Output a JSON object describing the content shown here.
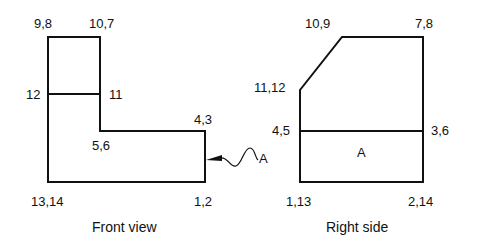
{
  "diagram": {
    "type": "orthographic-projection",
    "views": [
      {
        "id": "front",
        "title": "Front view",
        "vertex_labels": {
          "top_left": "9,8",
          "top_right": "10,7",
          "mid_left": "12",
          "mid_right": "11",
          "step_outer": "4,3",
          "step_inner": "5,6",
          "bottom_left": "13,14",
          "bottom_right": "1,2"
        },
        "leader_label": "A"
      },
      {
        "id": "right",
        "title": "Right side",
        "vertex_labels": {
          "top_left": "10,9",
          "top_right": "7,8",
          "chamfer_left": "11,12",
          "mid_left": "4,5",
          "mid_right": "3,6",
          "bottom_left": "1,13",
          "bottom_right": "2,14"
        },
        "face_label": "A"
      }
    ],
    "colors": {
      "line": "#111111",
      "background": "#ffffff"
    }
  }
}
